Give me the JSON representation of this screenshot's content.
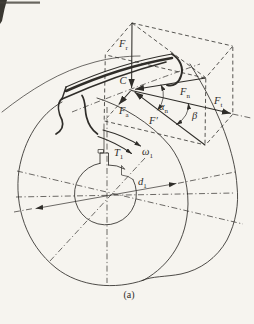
{
  "figure": {
    "caption": "(a)",
    "labels": {
      "contact_point": {
        "main": "C",
        "sub": ""
      },
      "force_radial": {
        "main": "F",
        "sub": "r"
      },
      "force_normal": {
        "main": "F",
        "sub": "n"
      },
      "force_axial": {
        "main": "F",
        "sub": "a"
      },
      "force_tangential": {
        "main": "F",
        "sub": "t"
      },
      "force_plane_component": {
        "main": "F′",
        "sub": ""
      },
      "angle_normal_pressure": {
        "main": "α",
        "sub": "n"
      },
      "angle_helix": {
        "main": "β",
        "sub": ""
      },
      "torque": {
        "main": "T",
        "sub": "1"
      },
      "angular_velocity": {
        "main": "ω",
        "sub": "1"
      },
      "pitch_diameter": {
        "main": "d",
        "sub": "1"
      }
    },
    "colors": {
      "ink": "#2f2d29",
      "paper": "#f6f4ef"
    }
  }
}
